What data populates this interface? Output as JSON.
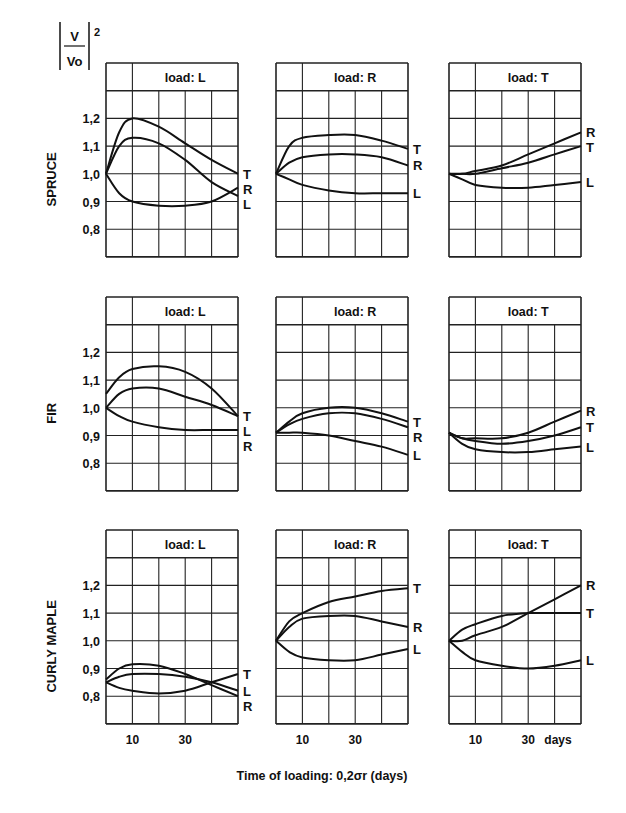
{
  "figure": {
    "ylabel_num": "V",
    "ylabel_den": "Vo",
    "ylabel_exp": "2",
    "xlabel": "Time of loading: 0,2σr (days)",
    "x_unit_label": "days",
    "x_tick_labels": [
      "10",
      "30"
    ],
    "y_tick_labels": [
      "1,2",
      "1,1",
      "1,0",
      "0,9",
      "0,8"
    ],
    "row_labels": [
      "SPRUCE",
      "FIR",
      "CURLY MAPLE"
    ],
    "panel_titles": [
      "load: L",
      "load: R",
      "load: T"
    ]
  },
  "chart_data": [
    {
      "type": "line",
      "species": "SPRUCE",
      "title": "load: L",
      "xlabel": "Time of loading (days)",
      "ylabel": "|V/Vo|^2",
      "xlim": [
        0,
        50
      ],
      "ylim": [
        0.7,
        1.4
      ],
      "grid": true,
      "x": [
        0,
        5,
        10,
        20,
        30,
        40,
        50
      ],
      "series": [
        {
          "name": "T",
          "values": [
            1.0,
            1.15,
            1.2,
            1.17,
            1.11,
            1.05,
            1.0
          ]
        },
        {
          "name": "L",
          "values": [
            1.0,
            1.1,
            1.13,
            1.11,
            1.05,
            0.97,
            0.92
          ]
        },
        {
          "name": "R",
          "values": [
            1.0,
            0.93,
            0.9,
            0.885,
            0.885,
            0.9,
            0.95
          ]
        }
      ]
    },
    {
      "type": "line",
      "species": "SPRUCE",
      "title": "load: R",
      "xlim": [
        0,
        50
      ],
      "ylim": [
        0.7,
        1.4
      ],
      "grid": true,
      "x": [
        0,
        5,
        10,
        20,
        30,
        40,
        50
      ],
      "series": [
        {
          "name": "T",
          "values": [
            1.0,
            1.1,
            1.13,
            1.14,
            1.14,
            1.12,
            1.09
          ]
        },
        {
          "name": "R",
          "values": [
            1.0,
            1.04,
            1.06,
            1.07,
            1.07,
            1.06,
            1.03
          ]
        },
        {
          "name": "L",
          "values": [
            1.0,
            0.98,
            0.96,
            0.94,
            0.93,
            0.93,
            0.93
          ]
        }
      ]
    },
    {
      "type": "line",
      "species": "SPRUCE",
      "title": "load: T",
      "xlim": [
        0,
        50
      ],
      "ylim": [
        0.7,
        1.4
      ],
      "grid": true,
      "x": [
        0,
        5,
        10,
        20,
        30,
        40,
        50
      ],
      "series": [
        {
          "name": "R",
          "values": [
            1.0,
            1.0,
            1.01,
            1.03,
            1.07,
            1.11,
            1.15
          ]
        },
        {
          "name": "T",
          "values": [
            1.0,
            1.0,
            1.0,
            1.02,
            1.04,
            1.07,
            1.1
          ]
        },
        {
          "name": "L",
          "values": [
            1.0,
            0.98,
            0.96,
            0.95,
            0.95,
            0.96,
            0.97
          ]
        }
      ]
    },
    {
      "type": "line",
      "species": "FIR",
      "title": "load: L",
      "xlim": [
        0,
        50
      ],
      "ylim": [
        0.7,
        1.4
      ],
      "grid": true,
      "x": [
        0,
        5,
        10,
        20,
        30,
        40,
        50
      ],
      "series": [
        {
          "name": "T",
          "values": [
            1.05,
            1.11,
            1.14,
            1.15,
            1.13,
            1.07,
            0.97
          ]
        },
        {
          "name": "L",
          "values": [
            1.0,
            1.05,
            1.07,
            1.07,
            1.04,
            1.01,
            0.97
          ]
        },
        {
          "name": "R",
          "values": [
            1.0,
            0.97,
            0.95,
            0.93,
            0.92,
            0.92,
            0.92
          ]
        }
      ]
    },
    {
      "type": "line",
      "species": "FIR",
      "title": "load: R",
      "xlim": [
        0,
        50
      ],
      "ylim": [
        0.7,
        1.4
      ],
      "grid": true,
      "x": [
        0,
        5,
        10,
        20,
        30,
        40,
        50
      ],
      "series": [
        {
          "name": "T",
          "values": [
            0.91,
            0.95,
            0.98,
            1.0,
            1.0,
            0.98,
            0.95
          ]
        },
        {
          "name": "R",
          "values": [
            0.91,
            0.94,
            0.96,
            0.98,
            0.98,
            0.96,
            0.93
          ]
        },
        {
          "name": "L",
          "values": [
            0.91,
            0.91,
            0.91,
            0.9,
            0.88,
            0.86,
            0.83
          ]
        }
      ]
    },
    {
      "type": "line",
      "species": "FIR",
      "title": "load: T",
      "xlim": [
        0,
        50
      ],
      "ylim": [
        0.7,
        1.4
      ],
      "grid": true,
      "x": [
        0,
        5,
        10,
        20,
        30,
        40,
        50
      ],
      "series": [
        {
          "name": "R",
          "values": [
            0.91,
            0.89,
            0.89,
            0.89,
            0.91,
            0.95,
            0.99
          ]
        },
        {
          "name": "T",
          "values": [
            0.91,
            0.89,
            0.88,
            0.87,
            0.88,
            0.9,
            0.93
          ]
        },
        {
          "name": "L",
          "values": [
            0.91,
            0.87,
            0.85,
            0.84,
            0.84,
            0.85,
            0.86
          ]
        }
      ]
    },
    {
      "type": "line",
      "species": "CURLY MAPLE",
      "title": "load: L",
      "xlim": [
        0,
        50
      ],
      "ylim": [
        0.7,
        1.4
      ],
      "grid": true,
      "x": [
        0,
        5,
        10,
        20,
        30,
        40,
        50
      ],
      "series": [
        {
          "name": "T",
          "values": [
            0.85,
            0.83,
            0.82,
            0.81,
            0.82,
            0.85,
            0.88
          ]
        },
        {
          "name": "L",
          "values": [
            0.85,
            0.87,
            0.88,
            0.88,
            0.87,
            0.85,
            0.82
          ]
        },
        {
          "name": "R",
          "values": [
            0.86,
            0.9,
            0.915,
            0.91,
            0.88,
            0.84,
            0.8
          ]
        }
      ]
    },
    {
      "type": "line",
      "species": "CURLY MAPLE",
      "title": "load: R",
      "xlim": [
        0,
        50
      ],
      "ylim": [
        0.7,
        1.4
      ],
      "grid": true,
      "x": [
        0,
        5,
        10,
        20,
        30,
        40,
        50
      ],
      "series": [
        {
          "name": "T",
          "values": [
            1.0,
            1.07,
            1.1,
            1.14,
            1.16,
            1.18,
            1.19
          ]
        },
        {
          "name": "R",
          "values": [
            1.0,
            1.05,
            1.08,
            1.09,
            1.09,
            1.07,
            1.05
          ]
        },
        {
          "name": "L",
          "values": [
            1.0,
            0.96,
            0.94,
            0.93,
            0.93,
            0.95,
            0.97
          ]
        }
      ]
    },
    {
      "type": "line",
      "species": "CURLY MAPLE",
      "title": "load: T",
      "xlim": [
        0,
        50
      ],
      "ylim": [
        0.7,
        1.4
      ],
      "grid": true,
      "x": [
        0,
        5,
        10,
        20,
        30,
        40,
        50
      ],
      "series": [
        {
          "name": "R",
          "values": [
            1.0,
            1.0,
            1.02,
            1.05,
            1.1,
            1.15,
            1.2
          ]
        },
        {
          "name": "T",
          "values": [
            1.0,
            1.04,
            1.06,
            1.09,
            1.1,
            1.1,
            1.1
          ]
        },
        {
          "name": "L",
          "values": [
            1.0,
            0.96,
            0.93,
            0.91,
            0.9,
            0.91,
            0.93
          ]
        }
      ]
    }
  ]
}
